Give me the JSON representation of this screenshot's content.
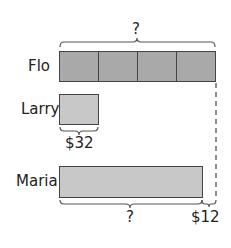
{
  "diagram": {
    "type": "tape-diagram",
    "rows": [
      {
        "name": "Flo",
        "segments": 4,
        "fill": "#a9a9a9",
        "top_brace_label": "?"
      },
      {
        "name": "Larry",
        "segments": 1,
        "fill": "#c8c8c8",
        "bottom_brace_label": "$32"
      },
      {
        "name": "Maria",
        "segments": 1,
        "fill": "#c8c8c8",
        "bottom_brace_label": "?",
        "difference_label": "$12"
      }
    ]
  },
  "labels": {
    "flo": "Flo",
    "larry": "Larry",
    "maria": "Maria",
    "flo_total": "?",
    "larry_value": "$32",
    "maria_total": "?",
    "maria_difference": "$12"
  }
}
